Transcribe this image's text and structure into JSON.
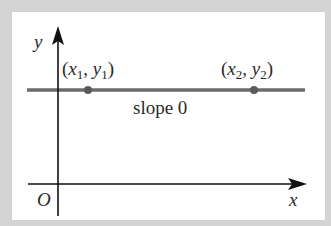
{
  "diagram": {
    "axes": {
      "x_label": "x",
      "y_label": "y",
      "origin_label": "O"
    },
    "line": {
      "label": "slope 0",
      "color": "#6b6b6b"
    },
    "points": [
      {
        "label_x": "x",
        "sub_x": "1",
        "label_y": "y",
        "sub_y": "1"
      },
      {
        "label_x": "x",
        "sub_x": "2",
        "label_y": "y",
        "sub_y": "2"
      }
    ],
    "colors": {
      "background": "#d4d4d4",
      "panel": "#ffffff",
      "axis": "#111111",
      "text": "#2a2a2a"
    }
  }
}
